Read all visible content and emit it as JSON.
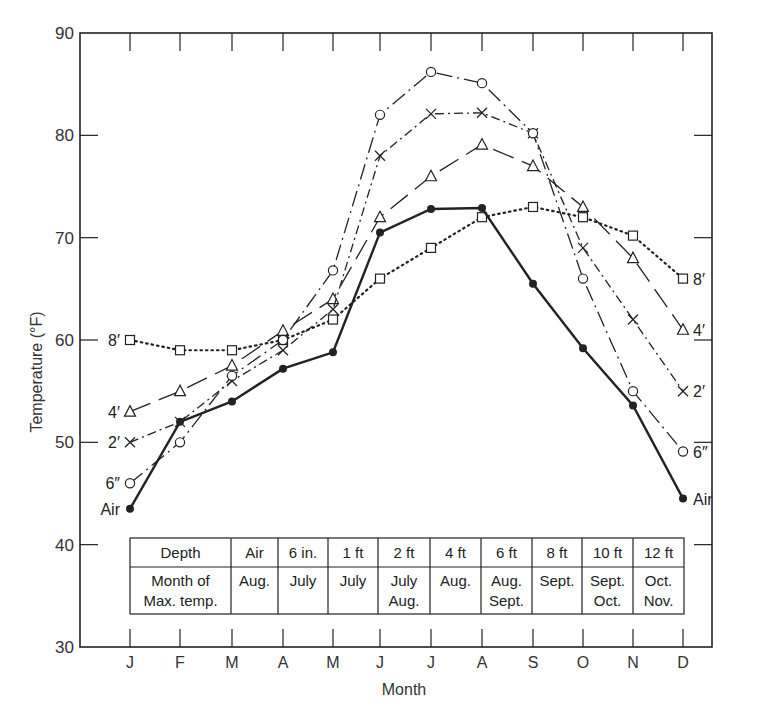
{
  "chart_data": {
    "type": "line",
    "title": "",
    "xlabel": "Month",
    "ylabel": "Temperature (°F)",
    "ylim": [
      30,
      90
    ],
    "yticks": [
      30,
      40,
      50,
      60,
      70,
      80,
      90
    ],
    "grid": false,
    "legend_position": "inline labels at line ends",
    "categories": [
      "J",
      "F",
      "M",
      "A",
      "M",
      "J",
      "J",
      "A",
      "S",
      "O",
      "N",
      "D"
    ],
    "series": [
      {
        "name": "Air",
        "label_left": "Air",
        "label_right": "Air",
        "marker": "filled-circle",
        "line_style": "solid-bold",
        "values": [
          43.5,
          52,
          54,
          57.2,
          58.8,
          70.5,
          72.8,
          72.9,
          65.5,
          59.2,
          53.6,
          44.5
        ]
      },
      {
        "name": "6 in.",
        "label_left": "6″",
        "label_right": "6″",
        "marker": "open-circle",
        "line_style": "dash-dot-long",
        "values": [
          46,
          50,
          56.5,
          60,
          66.8,
          82,
          86.2,
          85.1,
          80.2,
          66,
          55,
          49.1
        ]
      },
      {
        "name": "2 ft",
        "label_left": "2′",
        "label_right": "2′",
        "marker": "cross",
        "line_style": "dash-dot",
        "values": [
          50,
          52,
          56,
          59,
          63,
          78,
          82.1,
          82.2,
          80.2,
          69,
          62,
          55
        ]
      },
      {
        "name": "4 ft",
        "label_left": "4′",
        "label_right": "4′",
        "marker": "open-triangle",
        "line_style": "long-dash",
        "values": [
          53,
          55,
          57.5,
          60.9,
          64,
          72,
          76,
          79.1,
          77,
          73,
          68,
          61
        ]
      },
      {
        "name": "8 ft",
        "label_left": "8′",
        "label_right": "8′",
        "marker": "open-square",
        "line_style": "dotted",
        "values": [
          60,
          59,
          59,
          60,
          62,
          66,
          69,
          72,
          73,
          72,
          70.2,
          66
        ]
      }
    ],
    "annotation_table": {
      "header": [
        "Depth",
        "Air",
        "6 in.",
        "1 ft",
        "2 ft",
        "4 ft",
        "6 ft",
        "8 ft",
        "10 ft",
        "12 ft"
      ],
      "row_label": [
        "Month of",
        "Max. temp."
      ],
      "rows": [
        [
          "Aug."
        ],
        [
          "July"
        ],
        [
          "July"
        ],
        [
          "July",
          "Aug."
        ],
        [
          "Aug."
        ],
        [
          "Aug.",
          "Sept."
        ],
        [
          "Sept."
        ],
        [
          "Sept.",
          "Oct."
        ],
        [
          "Oct.",
          "Nov."
        ]
      ]
    }
  },
  "colors": {
    "ink": "#222222",
    "background": "#ffffff"
  }
}
